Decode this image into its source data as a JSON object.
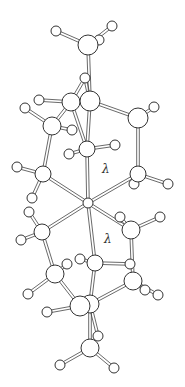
{
  "diagram": {
    "type": "ball-and-stick molecular structure",
    "labels": [
      {
        "text": "λ",
        "x": 102,
        "y": 166
      },
      {
        "text": "λ",
        "x": 104,
        "y": 236
      }
    ],
    "center_atom": {
      "x": 88,
      "y": 203,
      "r": 5
    },
    "atoms": [
      {
        "x": 88,
        "y": 45,
        "r": 10
      },
      {
        "x": 56,
        "y": 31,
        "r": 5
      },
      {
        "x": 112,
        "y": 26,
        "r": 5
      },
      {
        "x": 99,
        "y": 40,
        "r": 5
      },
      {
        "x": 85,
        "y": 78,
        "r": 5
      },
      {
        "x": 71,
        "y": 102,
        "r": 9
      },
      {
        "x": 90,
        "y": 101,
        "r": 10
      },
      {
        "x": 39,
        "y": 100,
        "r": 5
      },
      {
        "x": 25,
        "y": 108,
        "r": 5
      },
      {
        "x": 52,
        "y": 126,
        "r": 9
      },
      {
        "x": 72,
        "y": 130,
        "r": 5
      },
      {
        "x": 138,
        "y": 118,
        "r": 10
      },
      {
        "x": 154,
        "y": 107,
        "r": 5
      },
      {
        "x": 87,
        "y": 149,
        "r": 8
      },
      {
        "x": 115,
        "y": 145,
        "r": 5
      },
      {
        "x": 69,
        "y": 154,
        "r": 5
      },
      {
        "x": 43,
        "y": 174,
        "r": 8
      },
      {
        "x": 17,
        "y": 167,
        "r": 5
      },
      {
        "x": 32,
        "y": 198,
        "r": 5
      },
      {
        "x": 138,
        "y": 174,
        "r": 8
      },
      {
        "x": 168,
        "y": 184,
        "r": 5
      },
      {
        "x": 134,
        "y": 184,
        "r": 5
      },
      {
        "x": 42,
        "y": 232,
        "r": 8
      },
      {
        "x": 29,
        "y": 212,
        "r": 5
      },
      {
        "x": 21,
        "y": 240,
        "r": 5
      },
      {
        "x": 131,
        "y": 230,
        "r": 9
      },
      {
        "x": 160,
        "y": 217,
        "r": 5
      },
      {
        "x": 120,
        "y": 217,
        "r": 5
      },
      {
        "x": 95,
        "y": 263,
        "r": 8
      },
      {
        "x": 80,
        "y": 259,
        "r": 5
      },
      {
        "x": 130,
        "y": 264,
        "r": 5
      },
      {
        "x": 55,
        "y": 274,
        "r": 9
      },
      {
        "x": 67,
        "y": 264,
        "r": 5
      },
      {
        "x": 28,
        "y": 294,
        "r": 5
      },
      {
        "x": 133,
        "y": 281,
        "r": 9
      },
      {
        "x": 158,
        "y": 295,
        "r": 5
      },
      {
        "x": 145,
        "y": 290,
        "r": 5
      },
      {
        "x": 90,
        "y": 304,
        "r": 9
      },
      {
        "x": 80,
        "y": 306,
        "r": 10
      },
      {
        "x": 47,
        "y": 312,
        "r": 5
      },
      {
        "x": 98,
        "y": 336,
        "r": 5
      },
      {
        "x": 90,
        "y": 348,
        "r": 9
      },
      {
        "x": 60,
        "y": 365,
        "r": 5
      },
      {
        "x": 114,
        "y": 368,
        "r": 5
      }
    ],
    "bonds": [
      [
        0,
        1
      ],
      [
        0,
        2
      ],
      [
        0,
        3
      ],
      [
        0,
        6
      ],
      [
        4,
        6
      ],
      [
        4,
        5
      ],
      [
        6,
        11
      ],
      [
        11,
        12
      ],
      [
        5,
        7
      ],
      [
        5,
        9
      ],
      [
        9,
        8
      ],
      [
        9,
        10
      ],
      [
        6,
        13
      ],
      [
        5,
        13
      ],
      [
        13,
        14
      ],
      [
        13,
        15
      ],
      [
        9,
        16
      ],
      [
        16,
        17
      ],
      [
        16,
        18
      ],
      [
        11,
        19
      ],
      [
        19,
        20
      ],
      [
        19,
        21
      ],
      [
        13,
        -1
      ],
      [
        16,
        -1
      ],
      [
        19,
        -1
      ],
      [
        22,
        -1
      ],
      [
        25,
        -1
      ],
      [
        28,
        -1
      ],
      [
        22,
        23
      ],
      [
        22,
        24
      ],
      [
        22,
        31
      ],
      [
        25,
        26
      ],
      [
        25,
        27
      ],
      [
        25,
        34
      ],
      [
        28,
        29
      ],
      [
        28,
        30
      ],
      [
        28,
        37
      ],
      [
        31,
        32
      ],
      [
        31,
        33
      ],
      [
        31,
        38
      ],
      [
        34,
        35
      ],
      [
        34,
        36
      ],
      [
        34,
        37
      ],
      [
        37,
        38
      ],
      [
        38,
        39
      ],
      [
        37,
        40
      ],
      [
        37,
        41
      ],
      [
        41,
        42
      ],
      [
        41,
        43
      ]
    ]
  }
}
